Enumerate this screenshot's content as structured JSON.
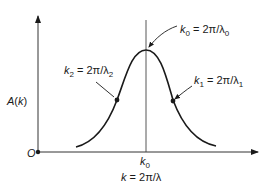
{
  "diagram": {
    "type": "gaussian-wave-packet-spectrum",
    "y_axis": {
      "label": "A(k)"
    },
    "x_axis": {
      "label": "k = 2π/λ",
      "tick_label": "k",
      "tick_sub": "0"
    },
    "origin_label": "O",
    "annotations": [
      {
        "id": "k0",
        "var": "k",
        "sub": "0",
        "eq": " = 2π/λ",
        "lam_sub": "0"
      },
      {
        "id": "k1",
        "var": "k",
        "sub": "1",
        "eq": " = 2π/λ",
        "lam_sub": "1"
      },
      {
        "id": "k2",
        "var": "k",
        "sub": "2",
        "eq": " = 2π/λ",
        "lam_sub": "2"
      }
    ],
    "colors": {
      "line": "#1a1a1a",
      "axis": "#333333",
      "background": "#ffffff"
    }
  }
}
